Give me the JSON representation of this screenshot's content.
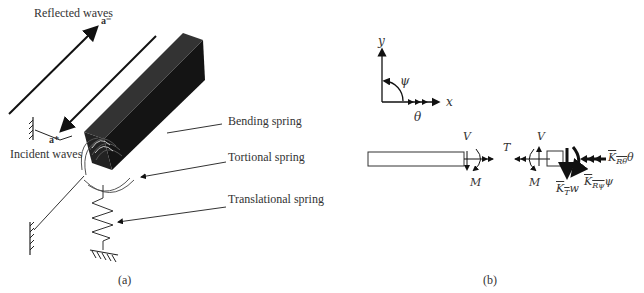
{
  "panel_a": {
    "caption": "(a)",
    "labels": {
      "reflected_waves": "Reflected waves",
      "a_minus": "a⁻",
      "a_plus": "a⁺",
      "incident_waves": "Incident waves",
      "bending_spring": "Bending spring",
      "torsional_spring": "Tortional spring",
      "translational_spring": "Translational spring"
    }
  },
  "panel_b": {
    "caption": "(b)",
    "axes": {
      "y": "y",
      "x": "x",
      "psi": "ψ",
      "theta": "θ"
    },
    "forces": {
      "V_left": "V",
      "M_left": "M",
      "T": "T",
      "V_right": "V",
      "M_right": "M",
      "K_R_theta_sym": "K",
      "K_R_theta_sub": "Rθ",
      "K_R_theta_var": "θ",
      "K_R_psi_sym": "K",
      "K_R_psi_sub": "Rψ",
      "K_R_psi_var": "ψ",
      "K_T_sym": "K",
      "K_T_sub": "T",
      "K_T_var": "w"
    }
  }
}
